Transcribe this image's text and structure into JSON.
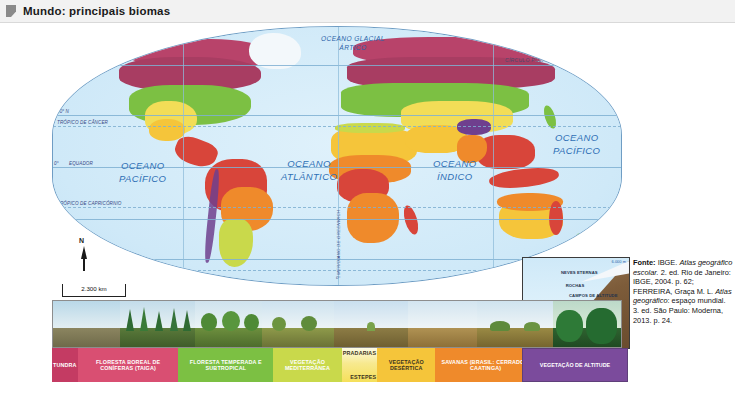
{
  "header": {
    "title": "Mundo: principais biomas",
    "marker_icon": "bookmark-icon"
  },
  "map": {
    "projection_note": "world map",
    "ocean_labels": [
      {
        "name": "OCEANO GLACIAL",
        "name2": "ÁRTICO"
      },
      {
        "name": "OCEANO",
        "name2": "PACÍFICO"
      },
      {
        "name": "OCEANO",
        "name2": "ATLÂNTICO"
      },
      {
        "name": "OCEANO",
        "name2": "ÍNDICO"
      },
      {
        "name": "OCEANO",
        "name2": "PACÍFICO"
      }
    ],
    "latitude_labels": [
      "60° N",
      "30° N",
      "TRÓPICO DE CÂNCER",
      "0°",
      "EQUADOR",
      "TRÓPICO DE CAPRICÓRNIO",
      "30° S",
      "60° S",
      "CÍRCULO POLAR ANTÁRTICO"
    ],
    "arctic_circle_label": "CÍRCULO POLAR ÁRTICO",
    "meridian_label": "MERIDIANO DE GREENWICH",
    "meridian_value": "0°",
    "compass_label": "N",
    "scale_label": "2.300 km"
  },
  "altitude_inset": {
    "top_value": "6.000 m",
    "bands": [
      "NEVES\nETERNAS",
      "ROCHAS",
      "CAMPOS\nDE\nALTITUDE",
      "FLORESTA\nBOREAL",
      "FLORESTA\nTEMPERADA",
      "PRADARIAS"
    ],
    "band_1": "NEVES ETERNAS",
    "band_2": "ROCHAS",
    "band_3": "CAMPOS DE ALTITUDE",
    "band_4": "FLORESTA BOREAL",
    "band_5": "FLORESTA TEMPERADA",
    "band_6": "PRADARIAS"
  },
  "legend": {
    "items": [
      {
        "label": "TUNDRA",
        "color": "#c43b63",
        "width": 10.2
      },
      {
        "label": "FLORESTA BOREAL DE CONÍFERAS (TAIGA)",
        "color": "#d94f72",
        "width": 11.5
      },
      {
        "label": "FLORESTA TEMPERADA E SUBTROPICAL",
        "color": "#7cc043",
        "width": 10.2
      },
      {
        "label": "VEGETAÇÃO MEDITERRÂNEA",
        "color": "#c9d94b",
        "width": 11.0
      },
      {
        "label": "PRADARIAS",
        "label2": "ESTEPES",
        "color": "#f5e05a",
        "width": 11.2
      },
      {
        "label": "VEGETAÇÃO DESÉRTICA",
        "color": "#f5c53a",
        "width": 10.5
      },
      {
        "label": "SAVANAS (BRASIL: CERRADO E CAATINGA)",
        "color": "#ef8a2b",
        "width": 11.6
      },
      {
        "label": "FLORESTA TROPICAL E EQUATORIAL",
        "color": "#d8453a",
        "width": 10.4
      }
    ],
    "altitude": {
      "label": "VEGETAÇÃO DE ALTITUDE",
      "color": "#7b4b9c"
    }
  },
  "source": {
    "prefix": "Fonte:",
    "line1": " IBGE. ",
    "italic1": "Atlas geográfico escolar.",
    "line2": "2. ed. Rio de Janeiro: IBGE, 2004. p. 62;",
    "line3": "FERREIRA, Graça M. L. ",
    "italic2": "Atlas geográfico",
    "line4": ": espaço mundial. 3. ed.",
    "line5": "São Paulo: Moderna, 2013. p. 24.",
    "full": "Fonte: IBGE. Atlas geográfico escolar. 2. ed. Rio de Janeiro: IBGE, 2004. p. 62; FERREIRA, Graça M. L. Atlas geográfico: espaço mundial. 3. ed. São Paulo: Moderna, 2013. p. 24."
  }
}
